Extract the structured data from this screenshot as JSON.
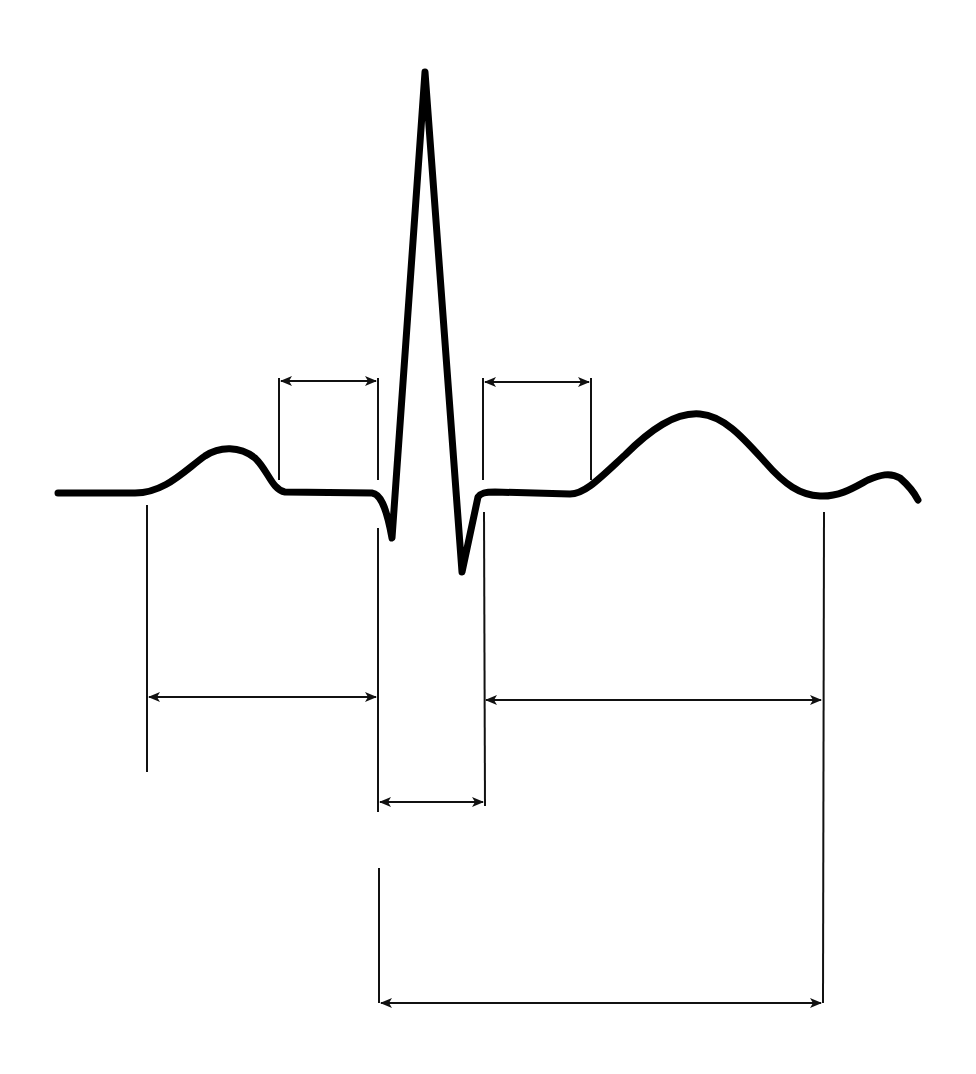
{
  "diagram": {
    "title": "",
    "colors": {
      "background": "#ffffff",
      "line": "#000000"
    },
    "waveform": {
      "name": "ecg-trace",
      "path": "M58,493 L135,493 C165,493 185,470 205,456 C220,446 240,446 255,458 C268,470 272,490 285,492 L372,493 C380,494 386,505 392,538 L425,72 L462,572 L478,497 C481,493 485,492 495,492 L570,494 C585,494 600,478 625,455 C650,430 675,412 700,414 C725,416 745,440 765,462 C785,485 800,495 820,496 C840,497 855,487 868,480 C880,475 890,472 900,478 C908,485 914,492 918,500"
    },
    "guides": [
      {
        "name": "pr-segment-start-guide",
        "x1": 279,
        "y1": 378,
        "x2": 279,
        "y2": 480
      },
      {
        "name": "pr-segment-end-guide",
        "x1": 378,
        "y1": 378,
        "x2": 378,
        "y2": 480
      },
      {
        "name": "st-segment-start-guide",
        "x1": 483,
        "y1": 378,
        "x2": 483,
        "y2": 480
      },
      {
        "name": "st-segment-end-guide",
        "x1": 591,
        "y1": 378,
        "x2": 591,
        "y2": 480
      },
      {
        "name": "p-wave-start-guide",
        "x1": 147,
        "y1": 505,
        "x2": 147,
        "y2": 772
      },
      {
        "name": "qrs-start-guide-upper",
        "x1": 378,
        "y1": 528,
        "x2": 378,
        "y2": 812
      },
      {
        "name": "qrs-start-guide-lower",
        "x1": 379,
        "y1": 868,
        "x2": 379,
        "y2": 1003
      },
      {
        "name": "qrs-end-guide",
        "x1": 484,
        "y1": 512,
        "x2": 485,
        "y2": 806
      },
      {
        "name": "t-wave-end-guide",
        "x1": 824,
        "y1": 512,
        "x2": 823,
        "y2": 1003
      }
    ],
    "intervals": [
      {
        "name": "pr-segment",
        "x1": 281,
        "x2": 376,
        "y": 381
      },
      {
        "name": "st-segment",
        "x1": 485,
        "x2": 589,
        "y": 382
      },
      {
        "name": "pr-interval",
        "x1": 149,
        "x2": 376,
        "y": 697
      },
      {
        "name": "qt-after-qrs-interval",
        "x1": 486,
        "x2": 821,
        "y": 700
      },
      {
        "name": "qrs-duration",
        "x1": 380,
        "x2": 483,
        "y": 802
      },
      {
        "name": "qt-interval",
        "x1": 381,
        "x2": 821,
        "y": 1003
      }
    ]
  }
}
